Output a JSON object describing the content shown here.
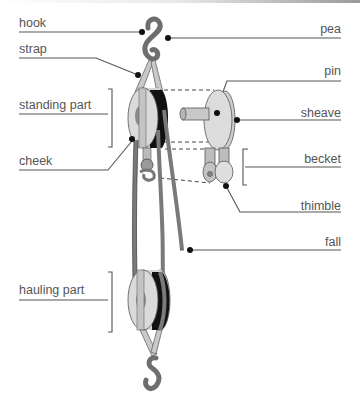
{
  "diagram": {
    "labels_left": [
      {
        "id": "hook",
        "text": "hook"
      },
      {
        "id": "strap",
        "text": "strap"
      },
      {
        "id": "standing-part",
        "text": "standing part"
      },
      {
        "id": "cheek",
        "text": "cheek"
      },
      {
        "id": "hauling-part",
        "text": "hauling part"
      }
    ],
    "labels_right": [
      {
        "id": "pea",
        "text": "pea"
      },
      {
        "id": "pin",
        "text": "pin"
      },
      {
        "id": "sheave",
        "text": "sheave"
      },
      {
        "id": "becket",
        "text": "becket"
      },
      {
        "id": "thimble",
        "text": "thimble"
      },
      {
        "id": "fall",
        "text": "fall"
      }
    ],
    "colors": {
      "label_text": "#555555",
      "leader_line": "#555555",
      "pulley_face": "#d9d9d9",
      "pulley_dark": "#8a8a8a",
      "rope": "#7a7a7a",
      "groove": "#111111"
    }
  }
}
